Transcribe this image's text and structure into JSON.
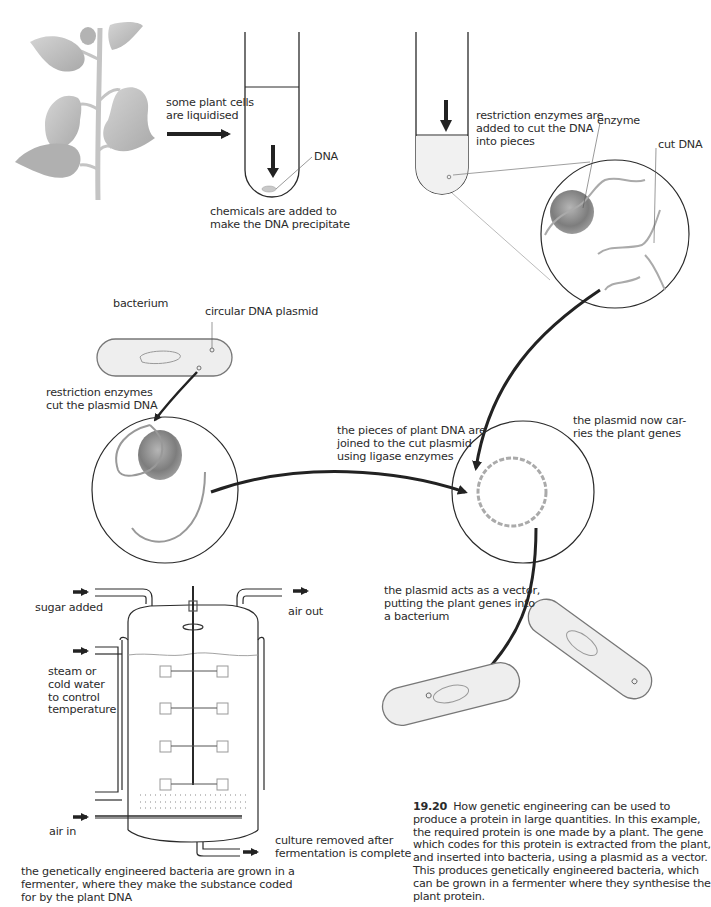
{
  "figure": {
    "number": "19.20",
    "caption": "How genetic engineering can be used to produce a protein in large quantities. In this example, the required protein is one made by a plant. The gene which codes for this protein is extracted from the plant, and inserted into bacteria, using a plasmid as a vector. This produces genetically engineered bacteria, which can be grown in a fermenter where they synthesise the plant protein."
  },
  "labels": {
    "liquidised": "some plant cells\nare liquidised",
    "dna": "DNA",
    "precipitate": "chemicals are added to\nmake the DNA precipitate",
    "restriction_top": "restriction enzymes are\nadded to cut the DNA\ninto pieces",
    "enzyme": "enzyme",
    "cut_dna": "cut DNA",
    "bacterium": "bacterium",
    "circular_plasmid": "circular DNA plasmid",
    "restriction_plasmid": "restriction enzymes\ncut the plasmid DNA",
    "ligase": "the pieces of plant DNA are\njoined to the cut plasmid\nusing ligase enzymes",
    "plasmid_carries": "the plasmid now car-\nries the plant genes",
    "vector": "the plasmid acts as a vector,\nputting the plant genes into\na bacterium",
    "sugar": "sugar added",
    "air_out": "air out",
    "steam": "steam or\ncold water\nto control\ntemperature",
    "air_in": "air in",
    "culture": "culture removed after\nfermentation is complete",
    "fermenter_desc": "the genetically engineered bacteria are grown in a\nfermenter, where they make the substance coded\nfor by the plant DNA"
  },
  "colors": {
    "line": "#2a2a2a",
    "arrow": "#222222",
    "plant": "#b8b8b8",
    "enzyme": "#8a8a8a",
    "bacterium_fill": "#eeeeee"
  }
}
